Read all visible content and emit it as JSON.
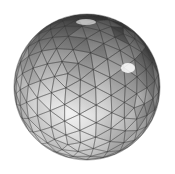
{
  "figure": {
    "width": 175,
    "height": 174,
    "background": "#ffffff",
    "sphere": {
      "cx": 87,
      "cy": 87,
      "r": 73,
      "subdivisions": 5,
      "tilt_x_deg": 22,
      "tilt_y_deg": -18,
      "colors": {
        "highlight": "#f4f4f4",
        "light": "#d8d8d8",
        "mid": "#a8a8a8",
        "dark": "#6e6e6e",
        "rim": "#4a4a4a",
        "edge": "#3c3c3c",
        "specular": "#ffffff"
      },
      "edge_opacity": 0.55,
      "edge_width": 0.7,
      "specular_spots": [
        {
          "x": 128,
          "y": 68,
          "rx": 7,
          "ry": 5,
          "opacity": 0.85
        },
        {
          "x": 86,
          "y": 22,
          "rx": 10,
          "ry": 3,
          "opacity": 0.6
        }
      ]
    }
  }
}
